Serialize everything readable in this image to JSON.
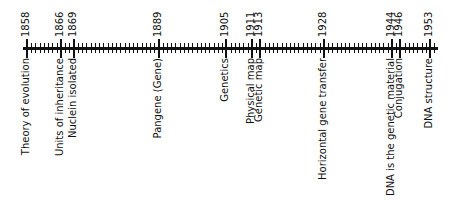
{
  "timeline": {
    "start_year": 1858,
    "end_year": 1953,
    "axis_start_px": 23,
    "axis_end_px": 438,
    "year_1858_px": 27,
    "px_per_year": 4.242,
    "line_color": "#111111",
    "events": [
      {
        "year": "1858",
        "label": "Theory of evolution"
      },
      {
        "year": "1866",
        "label": "Units of inheritance"
      },
      {
        "year": "1869",
        "label": "Nuclein isolated"
      },
      {
        "year": "1889",
        "label": "Pangene (Gene)"
      },
      {
        "year": "1905",
        "label": "Genetics"
      },
      {
        "year": "1911",
        "label": "Physical map"
      },
      {
        "year": "1913",
        "label": "Genetic map"
      },
      {
        "year": "1928",
        "label": "Horizontal gene transfer"
      },
      {
        "year": "1944",
        "label": "DNA is the genetic material"
      },
      {
        "year": "1946",
        "label": "Conjugation"
      },
      {
        "year": "1953",
        "label": "DNA structure"
      }
    ]
  }
}
